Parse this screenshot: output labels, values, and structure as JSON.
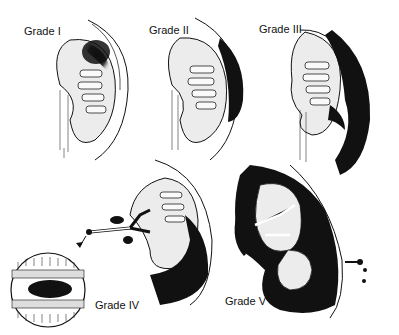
{
  "figure": {
    "panels": [
      {
        "id": "grade-1",
        "label": "Grade I",
        "x": 24,
        "y": 25
      },
      {
        "id": "grade-2",
        "label": "Grade II",
        "x": 149,
        "y": 24
      },
      {
        "id": "grade-3",
        "label": "Grade III",
        "x": 259,
        "y": 23
      },
      {
        "id": "grade-4",
        "label": "Grade IV",
        "x": 95,
        "y": 299
      },
      {
        "id": "grade-5",
        "label": "Grade V",
        "x": 225,
        "y": 295
      }
    ],
    "inset": {
      "label": "magnified vessel cross-section",
      "for": "Grade IV"
    }
  },
  "colors": {
    "ink": "#111111",
    "parenchyma": "#e8e8e8",
    "background": "#ffffff"
  }
}
